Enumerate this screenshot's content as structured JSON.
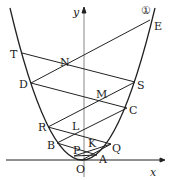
{
  "diagram": {
    "axis_x_label": "x",
    "axis_y_label": "y",
    "curve_label": "①",
    "points": {
      "O": "O",
      "A": "A",
      "P": "P",
      "Q": "Q",
      "K": "K",
      "B": "B",
      "L": "L",
      "R": "R",
      "C": "C",
      "M": "M",
      "D": "D",
      "S": "S",
      "N": "N",
      "T": "T",
      "E": "E"
    }
  }
}
